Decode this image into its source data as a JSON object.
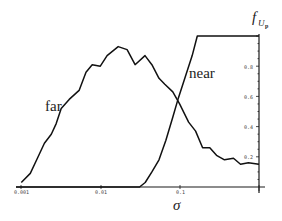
{
  "chart_data": {
    "type": "line",
    "title": "",
    "xlabel": "σ",
    "ylabel": "f_{U_p}",
    "ylabel_parts": {
      "base": "f",
      "sub": "U",
      "subsub": "p"
    },
    "xscale": "log",
    "xlim": [
      0.001,
      1
    ],
    "ylim": [
      0,
      1
    ],
    "grid": false,
    "legend": "inline labels",
    "x_ticks": [
      {
        "value": 0.001,
        "label": "0.001"
      },
      {
        "value": 0.01,
        "label": "0.01"
      },
      {
        "value": 0.1,
        "label": "0.1"
      },
      {
        "value": 1,
        "label": ""
      }
    ],
    "y_ticks": [
      {
        "value": 0.2,
        "label": "0.2"
      },
      {
        "value": 0.4,
        "label": "0.4"
      },
      {
        "value": 0.6,
        "label": "0.6"
      },
      {
        "value": 0.8,
        "label": "0.8"
      }
    ],
    "series": [
      {
        "name": "far",
        "x": [
          0.00101,
          0.00131,
          0.00161,
          0.00197,
          0.00241,
          0.00278,
          0.00321,
          0.00405,
          0.0054,
          0.0066,
          0.0079,
          0.01,
          0.0122,
          0.0168,
          0.0218,
          0.0275,
          0.0366,
          0.0448,
          0.055,
          0.065,
          0.082,
          0.1,
          0.13,
          0.159,
          0.195,
          0.24,
          0.292,
          0.368,
          0.478,
          0.586,
          0.737,
          1.0
        ],
        "y": [
          0.03,
          0.09,
          0.19,
          0.29,
          0.35,
          0.42,
          0.52,
          0.58,
          0.64,
          0.76,
          0.81,
          0.8,
          0.87,
          0.93,
          0.91,
          0.81,
          0.87,
          0.81,
          0.72,
          0.68,
          0.63,
          0.55,
          0.43,
          0.37,
          0.26,
          0.26,
          0.21,
          0.18,
          0.19,
          0.15,
          0.16,
          0.15
        ]
      },
      {
        "name": "near",
        "x": [
          0.001,
          0.0313,
          0.0368,
          0.0447,
          0.055,
          0.0671,
          0.0819,
          0.0965,
          0.118,
          0.144,
          0.167,
          1.0
        ],
        "y": [
          0.0,
          0.0,
          0.03,
          0.1,
          0.18,
          0.31,
          0.46,
          0.59,
          0.73,
          0.87,
          1.0,
          1.0
        ]
      }
    ],
    "annotations": [
      {
        "text": "far",
        "near_series": "far"
      },
      {
        "text": "near",
        "near_series": "near"
      }
    ]
  },
  "labels": {
    "far": "far",
    "near": "near",
    "xlabel": "σ",
    "ylabel_base": "f",
    "ylabel_sub": "U",
    "ylabel_subsub": "p",
    "xtick_0": "0.001",
    "xtick_1": "0.01",
    "xtick_2": "0.1",
    "ytick_02": "0.2",
    "ytick_04": "0.4",
    "ytick_06": "0.6",
    "ytick_08": "0.8"
  }
}
